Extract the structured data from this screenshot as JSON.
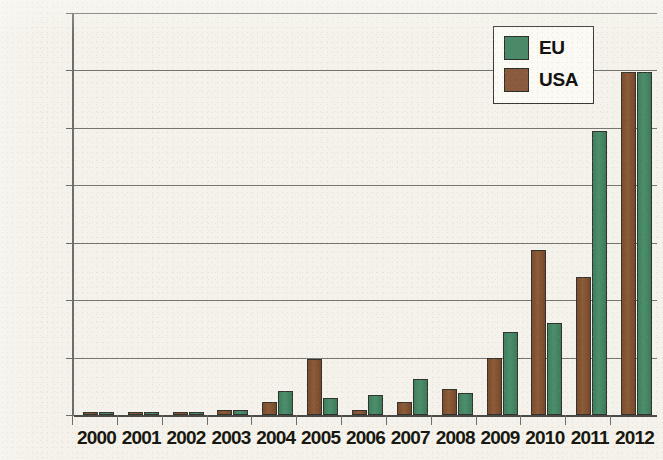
{
  "chart_data": {
    "type": "bar",
    "title": "",
    "subtitle": "",
    "xlabel": "",
    "ylabel": "",
    "categories": [
      "2000",
      "2001",
      "2002",
      "2003",
      "2004",
      "2005",
      "2006",
      "2007",
      "2008",
      "2009",
      "2010",
      "2011",
      "2012"
    ],
    "series": [
      {
        "name": "EU",
        "color": "#4a8a68",
        "values": [
          60,
          60,
          40,
          180,
          850,
          600,
          680,
          1250,
          750,
          2900,
          3200,
          9900,
          11950
        ]
      },
      {
        "name": "USA",
        "color": "#8a5a3c",
        "values": [
          70,
          70,
          50,
          180,
          450,
          1950,
          170,
          450,
          900,
          2000,
          5750,
          4800,
          11950
        ]
      }
    ],
    "ylim": [
      0,
      14000
    ],
    "yticks": [
      0,
      2000,
      4000,
      6000,
      8000,
      10000,
      12000,
      14000
    ],
    "ytick_labels": [
      "0",
      "2000",
      "4000",
      "6000",
      "8000",
      "10000",
      "12000",
      "14000"
    ],
    "grid": true,
    "grid_axis": "y",
    "legend": {
      "position": "top-right",
      "entries": [
        {
          "label": "EU",
          "color": "#4a8a68"
        },
        {
          "label": "USA",
          "color": "#8a5a3c"
        }
      ]
    },
    "background_color": "#f4f2ea",
    "axis_color": "#6e6e68"
  }
}
